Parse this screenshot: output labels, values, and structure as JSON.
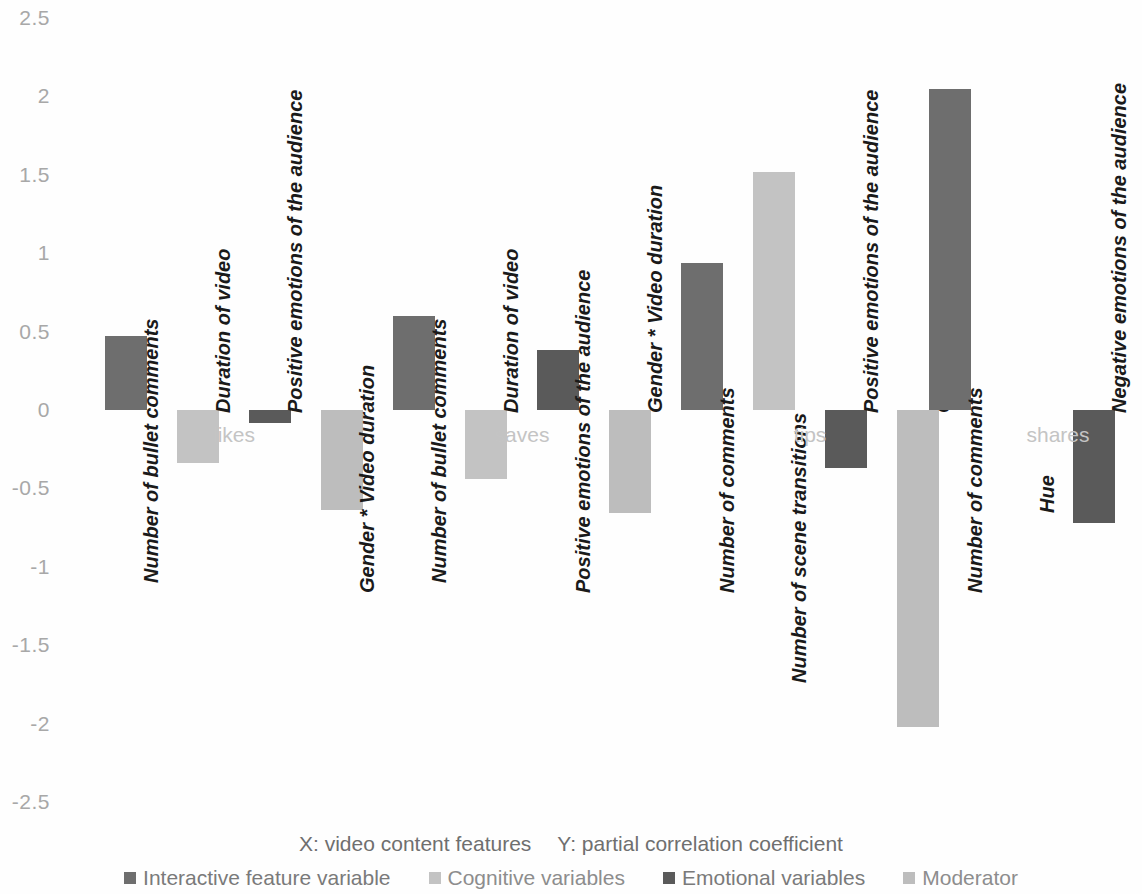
{
  "chart_data": {
    "type": "bar",
    "title": "",
    "xlabel": "X: video content features",
    "ylabel": "Y: partial correlation coefficient",
    "ylim": [
      -2.5,
      2.5
    ],
    "yticks": [
      "2.5",
      "2",
      "1.5",
      "1",
      "0.5",
      "0",
      "-0.5",
      "-1",
      "-1.5",
      "-2",
      "-2.5"
    ],
    "ytick_values": [
      2.5,
      2,
      1.5,
      1,
      0.5,
      0,
      -0.5,
      -1,
      -1.5,
      -2,
      -2.5
    ],
    "grid": false,
    "legend_position": "bottom",
    "series": [
      {
        "name": "Interactive feature variable",
        "color": "#6e6e6e"
      },
      {
        "name": "Cognitive variables",
        "color": "#c3c3c3"
      },
      {
        "name": "Emotional variables",
        "color": "#5a5a5a"
      },
      {
        "name": "Moderator",
        "color": "#bdbdbd"
      }
    ],
    "groups": [
      {
        "label": "likes",
        "bars": [
          {
            "label": "Number of bullet comments",
            "value": 0.47,
            "series": 0
          },
          {
            "label": "Duration of video",
            "value": -0.34,
            "series": 1
          },
          {
            "label": "Positive emotions of the audience",
            "value": -0.08,
            "series": 2
          },
          {
            "label": "Gender * Video duration",
            "value": -0.64,
            "series": 3
          }
        ]
      },
      {
        "label": "saves",
        "bars": [
          {
            "label": "Number of bullet comments",
            "value": 0.6,
            "series": 0
          },
          {
            "label": "Duration of video",
            "value": -0.44,
            "series": 1
          },
          {
            "label": "Positive emotions of the audience",
            "value": 0.38,
            "series": 2
          },
          {
            "label": "Gender * Video duration",
            "value": -0.66,
            "series": 3
          }
        ]
      },
      {
        "label": "tips",
        "bars": [
          {
            "label": "Number of comments",
            "value": 0.94,
            "series": 0
          },
          {
            "label": "Number of scene transitions",
            "value": 1.52,
            "series": 1
          },
          {
            "label": "Positive emotions of the audience",
            "value": -0.37,
            "series": 2
          },
          {
            "label": "Gender * Video duration",
            "value": -2.02,
            "series": 3
          }
        ]
      },
      {
        "label": "shares",
        "bars": [
          {
            "label": "Number of comments",
            "value": 2.05,
            "series": 0
          },
          {
            "label": "Hue",
            "value": 0.0,
            "series": 1
          },
          {
            "label": "Negative emotions of the audience",
            "value": -0.72,
            "series": 2
          },
          {
            "label": "Gender * Number of comments",
            "value": 1.61,
            "series": 3
          }
        ]
      }
    ]
  },
  "legend": {
    "items": [
      {
        "label": "Interactive feature variable",
        "color": "#6e6e6e"
      },
      {
        "label": "Cognitive variables",
        "color": "#c3c3c3"
      },
      {
        "label": "Emotional variables",
        "color": "#5a5a5a"
      },
      {
        "label": "Moderator",
        "color": "#bdbdbd"
      }
    ]
  },
  "caption": {
    "x_text": "X: video content features",
    "y_text": "Y: partial correlation coefficient"
  }
}
